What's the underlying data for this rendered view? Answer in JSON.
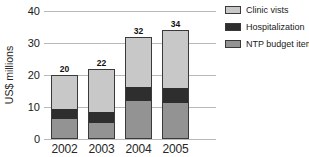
{
  "colors": {
    "background": "#ffffff",
    "gridline": "#b9b9b9",
    "bar_outline": "#3a3a3a",
    "text": "#1a1a1a",
    "clinic_visits": "#c8c8c8",
    "hospitalization": "#2e2e2e",
    "ntp_budget_items": "#939393"
  },
  "chart_data": {
    "type": "bar",
    "stacked": true,
    "title": "",
    "xlabel": "",
    "ylabel": "US$ millions",
    "ylim": [
      0,
      40
    ],
    "yticks": [
      0,
      10,
      20,
      30,
      40
    ],
    "grid": true,
    "legend_position": "right",
    "categories": [
      "2002",
      "2003",
      "2004",
      "2005"
    ],
    "series": [
      {
        "name": "NTP budget items",
        "color": "#939393",
        "values": [
          6.2,
          4.9,
          11.7,
          11.2
        ]
      },
      {
        "name": "Hospitalization",
        "color": "#2e2e2e",
        "values": [
          3.0,
          3.6,
          4.6,
          4.8
        ]
      },
      {
        "name": "Clinic vists",
        "color": "#c8c8c8",
        "values": [
          10.8,
          13.5,
          15.7,
          18.0
        ]
      }
    ],
    "totals": [
      20,
      22,
      32,
      34
    ],
    "bar_total_labels": [
      "20",
      "22",
      "32",
      "34"
    ],
    "legend": [
      {
        "label": "Clinic vists",
        "color": "#c8c8c8"
      },
      {
        "label": "Hospitalization",
        "color": "#2e2e2e"
      },
      {
        "label": "NTP budget items",
        "color": "#939393"
      }
    ]
  }
}
